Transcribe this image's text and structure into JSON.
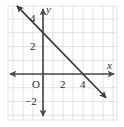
{
  "figure": {
    "width": 124,
    "height": 127,
    "background": "#ffffff",
    "grid_color": "#dcdcdc",
    "axis_color": "#4a4a4a",
    "line_color": "#3a3a3a",
    "text_color": "#2b2b2b"
  },
  "axes": {
    "x_label": "x",
    "y_label": "y",
    "origin_label": "O"
  },
  "ticks": {
    "x": [
      {
        "value": 2,
        "label": "2"
      },
      {
        "value": 4,
        "label": "4"
      }
    ],
    "y": [
      {
        "value": 4,
        "label": "4"
      },
      {
        "value": 2,
        "label": "2"
      },
      {
        "value": -2,
        "label": "−2"
      }
    ]
  },
  "chart_data": {
    "type": "line",
    "title": "",
    "xlabel": "x",
    "ylabel": "y",
    "grid": true,
    "legend": false,
    "xlim": [
      -3.5,
      7.4
    ],
    "ylim": [
      -3.4,
      5.0
    ],
    "xticks": [
      2,
      4
    ],
    "yticks": [
      -2,
      2,
      4
    ],
    "xticklabels": [
      "2",
      "4"
    ],
    "yticklabels": [
      "−2",
      "2",
      "4"
    ],
    "series": [
      {
        "name": "line",
        "equation": "y = -0.75x + 3",
        "slope": -0.75,
        "intercept": 3,
        "x_intercept": 4,
        "y_intercept": 3,
        "arrows": "both",
        "x": [
          -2.6,
          6.3
        ],
        "values": [
          4.95,
          -1.725
        ],
        "points": [
          {
            "x": 0,
            "y": 3
          },
          {
            "x": 4,
            "y": 0
          }
        ]
      }
    ]
  }
}
